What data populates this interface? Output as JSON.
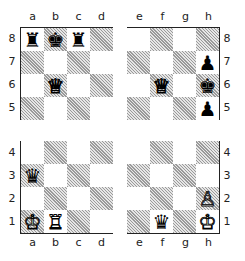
{
  "diagram": {
    "type": "chess-position",
    "files": [
      "a",
      "b",
      "c",
      "d",
      "e",
      "f",
      "g",
      "h"
    ],
    "ranks": [
      "8",
      "7",
      "6",
      "5",
      "4",
      "3",
      "2",
      "1"
    ],
    "quadrants": {
      "top_left": {
        "files": [
          "a",
          "b",
          "c",
          "d"
        ],
        "ranks": [
          "8",
          "7",
          "6",
          "5"
        ]
      },
      "top_right": {
        "files": [
          "e",
          "f",
          "g",
          "h"
        ],
        "ranks": [
          "8",
          "7",
          "6",
          "5"
        ]
      },
      "bottom_left": {
        "files": [
          "a",
          "b",
          "c",
          "d"
        ],
        "ranks": [
          "4",
          "3",
          "2",
          "1"
        ]
      },
      "bottom_right": {
        "files": [
          "e",
          "f",
          "g",
          "h"
        ],
        "ranks": [
          "4",
          "3",
          "2",
          "1"
        ]
      }
    },
    "pieces": [
      {
        "square": "a8",
        "piece": "rook",
        "color": "black",
        "glyph": "♜"
      },
      {
        "square": "b8",
        "piece": "king",
        "color": "black",
        "glyph": "♚"
      },
      {
        "square": "c8",
        "piece": "rook",
        "color": "black",
        "glyph": "♜"
      },
      {
        "square": "b6",
        "piece": "queen",
        "color": "white",
        "glyph": "♕"
      },
      {
        "square": "f6",
        "piece": "queen",
        "color": "white",
        "glyph": "♕"
      },
      {
        "square": "h7",
        "piece": "pawn",
        "color": "black",
        "glyph": "♟"
      },
      {
        "square": "h6",
        "piece": "king",
        "color": "black",
        "glyph": "♚"
      },
      {
        "square": "h5",
        "piece": "pawn",
        "color": "black",
        "glyph": "♟"
      },
      {
        "square": "a3",
        "piece": "queen",
        "color": "black",
        "glyph": "♛"
      },
      {
        "square": "a1",
        "piece": "king",
        "color": "white",
        "glyph": "♔"
      },
      {
        "square": "b1",
        "piece": "rook",
        "color": "white",
        "glyph": "♖"
      },
      {
        "square": "h2",
        "piece": "pawn",
        "color": "white",
        "glyph": "♙"
      },
      {
        "square": "f1",
        "piece": "queen",
        "color": "black",
        "glyph": "♛"
      },
      {
        "square": "h1",
        "piece": "king",
        "color": "white",
        "glyph": "♔"
      }
    ]
  }
}
